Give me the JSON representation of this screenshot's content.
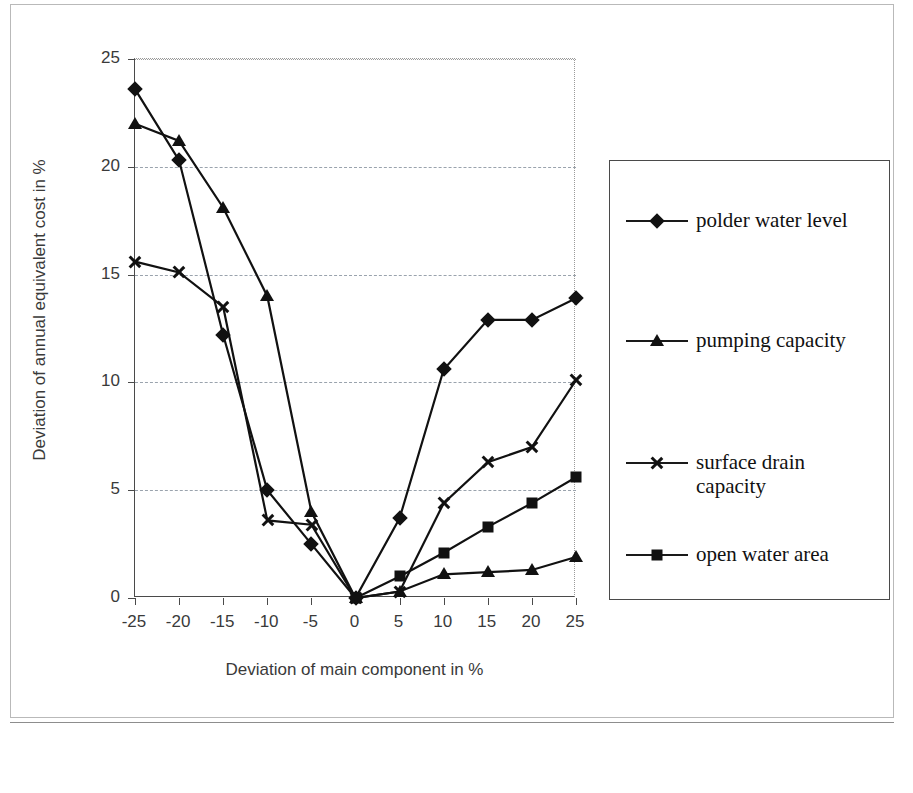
{
  "axes": {
    "x_title": "Deviation of main component in %",
    "y_title": "Deviation of annual equivalent cost in %",
    "x_ticks": [
      "-25",
      "-20",
      "-15",
      "-10",
      "-5",
      "0",
      "5",
      "10",
      "15",
      "20",
      "25"
    ],
    "y_ticks": [
      "0",
      "5",
      "10",
      "15",
      "20",
      "25"
    ]
  },
  "legend": {
    "items": [
      {
        "label": "polder water level",
        "marker": "diamond-marker"
      },
      {
        "label": "pumping capacity",
        "marker": "triangle-marker"
      },
      {
        "label": "surface drain capacity",
        "marker": "cross-marker"
      },
      {
        "label": "open water area",
        "marker": "square-marker"
      }
    ]
  },
  "chart_data": {
    "type": "line",
    "title": "",
    "xlabel": "Deviation of main component in %",
    "ylabel": "Deviation of annual equivalent cost in %",
    "x": [
      -25,
      -20,
      -15,
      -10,
      -5,
      0,
      5,
      10,
      15,
      20,
      25
    ],
    "xlim": [
      -25,
      25
    ],
    "ylim": [
      0,
      25
    ],
    "xticks": [
      -25,
      -20,
      -15,
      -10,
      -5,
      0,
      5,
      10,
      15,
      20,
      25
    ],
    "yticks": [
      0,
      5,
      10,
      15,
      20,
      25
    ],
    "grid": "horizontal-dashed",
    "legend_position": "right-outside",
    "series": [
      {
        "name": "polder water level",
        "marker": "diamond",
        "x": [
          -25,
          -20,
          -15,
          -10,
          -5,
          0,
          5,
          10,
          15,
          20,
          25
        ],
        "values": [
          23.6,
          20.3,
          12.2,
          5.0,
          2.5,
          0.0,
          3.7,
          10.6,
          12.9,
          12.9,
          13.9
        ]
      },
      {
        "name": "pumping capacity",
        "marker": "triangle",
        "x": [
          -25,
          -20,
          -15,
          -10,
          -5,
          0,
          5,
          10,
          15,
          20,
          25
        ],
        "values": [
          22.0,
          21.2,
          18.1,
          14.0,
          4.0,
          0.0,
          0.3,
          1.1,
          1.2,
          1.3,
          1.9
        ]
      },
      {
        "name": "surface drain capacity",
        "marker": "cross",
        "x": [
          -25,
          -20,
          -15,
          -10,
          -5,
          0,
          5,
          10,
          15,
          20,
          25
        ],
        "values": [
          15.6,
          15.1,
          13.5,
          3.6,
          3.4,
          0.0,
          0.3,
          4.4,
          6.3,
          7.0,
          10.1
        ]
      },
      {
        "name": "open water area",
        "marker": "square",
        "x": [
          0,
          5,
          10,
          15,
          20,
          25
        ],
        "values": [
          0.0,
          1.0,
          2.1,
          3.3,
          4.4,
          5.6
        ]
      }
    ]
  },
  "colors": {
    "ink": "#111111",
    "axis": "#4a4a4a",
    "grid": "#9aa3ad",
    "background": "#ffffff"
  }
}
